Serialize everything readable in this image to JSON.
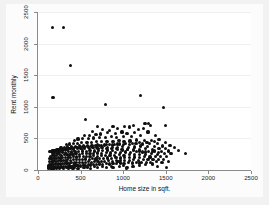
{
  "chart_data": {
    "type": "scatter",
    "title": "",
    "xlabel": "Home size in sqft.",
    "ylabel": "Rent monthly",
    "xlim": [
      0,
      2500
    ],
    "ylim": [
      0,
      2500
    ],
    "xticks": [
      0,
      500,
      1000,
      1500,
      2000,
      2500
    ],
    "yticks": [
      0,
      500,
      1000,
      1500,
      2000,
      2500
    ],
    "xticklabels": [
      "0",
      "500",
      "1000",
      "1500",
      "2000",
      "2500"
    ],
    "yticklabels": [
      "0",
      "500",
      "1000",
      "1500",
      "2000",
      "2500"
    ],
    "grid": "horizontal",
    "legend": "none",
    "marker": {
      "shape": "circle",
      "color": "#101010",
      "size": 3
    },
    "points": [
      [
        170,
        2250
      ],
      [
        300,
        2250
      ],
      [
        385,
        1655
      ],
      [
        175,
        1150
      ],
      [
        1200,
        1180
      ],
      [
        790,
        1035
      ],
      [
        1470,
        995
      ],
      [
        560,
        800
      ],
      [
        1500,
        700
      ],
      [
        1255,
        735
      ],
      [
        1300,
        730
      ],
      [
        1320,
        700
      ],
      [
        1120,
        700
      ],
      [
        1070,
        680
      ],
      [
        1015,
        690
      ],
      [
        880,
        690
      ],
      [
        700,
        690
      ],
      [
        930,
        660
      ],
      [
        1235,
        655
      ],
      [
        1180,
        640
      ],
      [
        840,
        620
      ],
      [
        760,
        640
      ],
      [
        640,
        615
      ],
      [
        1290,
        600
      ],
      [
        1135,
        590
      ],
      [
        1045,
        580
      ],
      [
        985,
        600
      ],
      [
        905,
        575
      ],
      [
        820,
        590
      ],
      [
        735,
        570
      ],
      [
        680,
        560
      ],
      [
        600,
        550
      ],
      [
        545,
        540
      ],
      [
        1380,
        540
      ],
      [
        1200,
        545
      ],
      [
        1100,
        535
      ],
      [
        1000,
        530
      ],
      [
        925,
        520
      ],
      [
        860,
        525
      ],
      [
        790,
        515
      ],
      [
        720,
        520
      ],
      [
        655,
        505
      ],
      [
        590,
        500
      ],
      [
        520,
        495
      ],
      [
        470,
        490
      ],
      [
        425,
        470
      ],
      [
        1420,
        480
      ],
      [
        1330,
        470
      ],
      [
        1250,
        465
      ],
      [
        1160,
        475
      ],
      [
        1080,
        460
      ],
      [
        1010,
        455
      ],
      [
        950,
        465
      ],
      [
        880,
        450
      ],
      [
        810,
        455
      ],
      [
        745,
        445
      ],
      [
        690,
        450
      ],
      [
        630,
        440
      ],
      [
        575,
        435
      ],
      [
        515,
        430
      ],
      [
        465,
        425
      ],
      [
        415,
        420
      ],
      [
        370,
        410
      ],
      [
        330,
        400
      ],
      [
        1500,
        430
      ],
      [
        1400,
        420
      ],
      [
        1310,
        415
      ],
      [
        1230,
        410
      ],
      [
        1150,
        420
      ],
      [
        1075,
        405
      ],
      [
        1000,
        400
      ],
      [
        930,
        410
      ],
      [
        870,
        395
      ],
      [
        805,
        400
      ],
      [
        750,
        390
      ],
      [
        695,
        395
      ],
      [
        640,
        385
      ],
      [
        585,
        390
      ],
      [
        535,
        380
      ],
      [
        485,
        385
      ],
      [
        440,
        375
      ],
      [
        395,
        370
      ],
      [
        350,
        365
      ],
      [
        310,
        360
      ],
      [
        270,
        350
      ],
      [
        1550,
        390
      ],
      [
        1460,
        380
      ],
      [
        1370,
        375
      ],
      [
        1285,
        370
      ],
      [
        1205,
        380
      ],
      [
        1130,
        365
      ],
      [
        1060,
        360
      ],
      [
        995,
        370
      ],
      [
        930,
        355
      ],
      [
        870,
        360
      ],
      [
        815,
        350
      ],
      [
        760,
        355
      ],
      [
        705,
        345
      ],
      [
        650,
        350
      ],
      [
        600,
        340
      ],
      [
        550,
        345
      ],
      [
        505,
        335
      ],
      [
        460,
        340
      ],
      [
        420,
        330
      ],
      [
        380,
        335
      ],
      [
        340,
        325
      ],
      [
        300,
        320
      ],
      [
        265,
        315
      ],
      [
        230,
        310
      ],
      [
        200,
        300
      ],
      [
        1600,
        350
      ],
      [
        1500,
        340
      ],
      [
        1420,
        335
      ],
      [
        1340,
        330
      ],
      [
        1265,
        340
      ],
      [
        1190,
        325
      ],
      [
        1120,
        320
      ],
      [
        1055,
        330
      ],
      [
        990,
        315
      ],
      [
        930,
        320
      ],
      [
        870,
        310
      ],
      [
        815,
        315
      ],
      [
        760,
        305
      ],
      [
        710,
        310
      ],
      [
        660,
        300
      ],
      [
        610,
        305
      ],
      [
        565,
        295
      ],
      [
        520,
        300
      ],
      [
        475,
        290
      ],
      [
        435,
        295
      ],
      [
        395,
        285
      ],
      [
        360,
        290
      ],
      [
        325,
        280
      ],
      [
        290,
        285
      ],
      [
        255,
        275
      ],
      [
        225,
        270
      ],
      [
        195,
        265
      ],
      [
        170,
        260
      ],
      [
        1650,
        310
      ],
      [
        1530,
        300
      ],
      [
        1450,
        295
      ],
      [
        1370,
        300
      ],
      [
        1295,
        290
      ],
      [
        1225,
        285
      ],
      [
        1155,
        295
      ],
      [
        1090,
        280
      ],
      [
        1030,
        285
      ],
      [
        970,
        275
      ],
      [
        910,
        280
      ],
      [
        855,
        270
      ],
      [
        800,
        275
      ],
      [
        750,
        265
      ],
      [
        700,
        270
      ],
      [
        655,
        260
      ],
      [
        610,
        265
      ],
      [
        565,
        255
      ],
      [
        525,
        260
      ],
      [
        485,
        250
      ],
      [
        445,
        255
      ],
      [
        410,
        245
      ],
      [
        375,
        250
      ],
      [
        340,
        240
      ],
      [
        310,
        245
      ],
      [
        280,
        235
      ],
      [
        250,
        240
      ],
      [
        220,
        230
      ],
      [
        195,
        235
      ],
      [
        170,
        225
      ],
      [
        145,
        220
      ],
      [
        1730,
        265
      ],
      [
        1560,
        255
      ],
      [
        1480,
        260
      ],
      [
        1400,
        250
      ],
      [
        1330,
        255
      ],
      [
        1260,
        245
      ],
      [
        1195,
        250
      ],
      [
        1130,
        240
      ],
      [
        1070,
        245
      ],
      [
        1010,
        235
      ],
      [
        955,
        240
      ],
      [
        900,
        230
      ],
      [
        845,
        235
      ],
      [
        795,
        225
      ],
      [
        745,
        230
      ],
      [
        700,
        220
      ],
      [
        655,
        225
      ],
      [
        610,
        215
      ],
      [
        570,
        220
      ],
      [
        530,
        210
      ],
      [
        490,
        215
      ],
      [
        455,
        205
      ],
      [
        420,
        210
      ],
      [
        385,
        200
      ],
      [
        355,
        205
      ],
      [
        320,
        195
      ],
      [
        290,
        200
      ],
      [
        265,
        190
      ],
      [
        240,
        195
      ],
      [
        215,
        185
      ],
      [
        190,
        190
      ],
      [
        165,
        180
      ],
      [
        140,
        185
      ],
      [
        1505,
        215
      ],
      [
        1440,
        210
      ],
      [
        1380,
        215
      ],
      [
        1315,
        205
      ],
      [
        1250,
        210
      ],
      [
        1190,
        200
      ],
      [
        1130,
        205
      ],
      [
        1075,
        195
      ],
      [
        1020,
        200
      ],
      [
        965,
        190
      ],
      [
        915,
        195
      ],
      [
        865,
        185
      ],
      [
        815,
        190
      ],
      [
        770,
        180
      ],
      [
        725,
        185
      ],
      [
        680,
        175
      ],
      [
        640,
        180
      ],
      [
        600,
        170
      ],
      [
        560,
        175
      ],
      [
        520,
        165
      ],
      [
        485,
        170
      ],
      [
        450,
        160
      ],
      [
        415,
        165
      ],
      [
        385,
        155
      ],
      [
        350,
        160
      ],
      [
        320,
        150
      ],
      [
        295,
        155
      ],
      [
        270,
        145
      ],
      [
        245,
        150
      ],
      [
        220,
        140
      ],
      [
        195,
        145
      ],
      [
        175,
        135
      ],
      [
        155,
        140
      ],
      [
        135,
        130
      ],
      [
        1470,
        170
      ],
      [
        1410,
        165
      ],
      [
        1350,
        170
      ],
      [
        1290,
        160
      ],
      [
        1235,
        165
      ],
      [
        1180,
        155
      ],
      [
        1125,
        160
      ],
      [
        1070,
        150
      ],
      [
        1020,
        155
      ],
      [
        970,
        145
      ],
      [
        920,
        150
      ],
      [
        875,
        140
      ],
      [
        830,
        145
      ],
      [
        785,
        135
      ],
      [
        745,
        140
      ],
      [
        705,
        130
      ],
      [
        665,
        135
      ],
      [
        625,
        125
      ],
      [
        590,
        130
      ],
      [
        555,
        120
      ],
      [
        520,
        125
      ],
      [
        485,
        115
      ],
      [
        455,
        120
      ],
      [
        425,
        110
      ],
      [
        395,
        115
      ],
      [
        365,
        105
      ],
      [
        340,
        110
      ],
      [
        315,
        100
      ],
      [
        290,
        105
      ],
      [
        265,
        95
      ],
      [
        245,
        100
      ],
      [
        225,
        90
      ],
      [
        205,
        95
      ],
      [
        185,
        85
      ],
      [
        165,
        90
      ],
      [
        150,
        80
      ],
      [
        135,
        85
      ],
      [
        120,
        75
      ],
      [
        1530,
        130
      ],
      [
        1455,
        125
      ],
      [
        1390,
        130
      ],
      [
        1325,
        120
      ],
      [
        1270,
        125
      ],
      [
        1215,
        115
      ],
      [
        1160,
        120
      ],
      [
        1110,
        110
      ],
      [
        1060,
        115
      ],
      [
        1010,
        105
      ],
      [
        965,
        110
      ],
      [
        920,
        100
      ],
      [
        880,
        105
      ],
      [
        840,
        95
      ],
      [
        800,
        100
      ],
      [
        760,
        90
      ],
      [
        725,
        95
      ],
      [
        690,
        85
      ],
      [
        655,
        90
      ],
      [
        620,
        80
      ],
      [
        590,
        85
      ],
      [
        560,
        75
      ],
      [
        530,
        80
      ],
      [
        500,
        70
      ],
      [
        470,
        75
      ],
      [
        445,
        65
      ],
      [
        420,
        70
      ],
      [
        395,
        60
      ],
      [
        370,
        65
      ],
      [
        345,
        55
      ],
      [
        325,
        60
      ],
      [
        300,
        50
      ],
      [
        280,
        55
      ],
      [
        260,
        45
      ],
      [
        240,
        50
      ],
      [
        220,
        40
      ],
      [
        200,
        45
      ],
      [
        185,
        35
      ],
      [
        170,
        40
      ],
      [
        155,
        30
      ],
      [
        140,
        35
      ],
      [
        125,
        28
      ],
      [
        1045,
        45
      ],
      [
        1510,
        40
      ],
      [
        880,
        35
      ],
      [
        805,
        42
      ],
      [
        700,
        38
      ],
      [
        615,
        30
      ],
      [
        540,
        35
      ],
      [
        470,
        25
      ],
      [
        410,
        32
      ],
      [
        355,
        22
      ],
      [
        300,
        28
      ],
      [
        255,
        18
      ],
      [
        215,
        24
      ],
      [
        180,
        15
      ],
      [
        150,
        20
      ],
      [
        1040,
        20
      ],
      [
        960,
        60
      ],
      [
        1115,
        60
      ],
      [
        1190,
        70
      ],
      [
        1265,
        85
      ],
      [
        1340,
        95
      ],
      [
        1400,
        60
      ],
      [
        1190,
        110
      ],
      [
        940,
        130
      ],
      [
        1000,
        70
      ],
      [
        860,
        60
      ],
      [
        760,
        55
      ],
      [
        660,
        60
      ],
      [
        580,
        48
      ],
      [
        500,
        52
      ],
      [
        430,
        45
      ],
      [
        375,
        48
      ],
      [
        330,
        40
      ],
      [
        285,
        44
      ],
      [
        245,
        36
      ],
      [
        210,
        40
      ],
      [
        175,
        32
      ],
      [
        145,
        38
      ],
      [
        125,
        48
      ],
      [
        1260,
        285
      ],
      [
        1340,
        290
      ],
      [
        1415,
        275
      ],
      [
        1195,
        300
      ],
      [
        1120,
        310
      ],
      [
        1048,
        320
      ],
      [
        985,
        330
      ],
      [
        920,
        335
      ],
      [
        860,
        340
      ],
      [
        800,
        345
      ],
      [
        745,
        350
      ],
      [
        690,
        355
      ],
      [
        640,
        360
      ],
      [
        590,
        365
      ],
      [
        545,
        360
      ],
      [
        500,
        355
      ],
      [
        460,
        350
      ],
      [
        420,
        345
      ],
      [
        385,
        340
      ],
      [
        350,
        335
      ],
      [
        318,
        330
      ],
      [
        288,
        325
      ],
      [
        260,
        320
      ],
      [
        235,
        315
      ],
      [
        212,
        310
      ],
      [
        190,
        305
      ],
      [
        170,
        300
      ],
      [
        152,
        295
      ],
      [
        1370,
        450
      ],
      [
        1280,
        440
      ],
      [
        1190,
        430
      ],
      [
        1105,
        425
      ],
      [
        1030,
        415
      ],
      [
        960,
        410
      ],
      [
        895,
        405
      ],
      [
        835,
        400
      ],
      [
        778,
        395
      ],
      [
        725,
        390
      ],
      [
        675,
        385
      ],
      [
        628,
        380
      ],
      [
        583,
        375
      ],
      [
        540,
        370
      ],
      [
        500,
        365
      ],
      [
        462,
        360
      ],
      [
        427,
        355
      ],
      [
        394,
        350
      ],
      [
        363,
        345
      ],
      [
        334,
        340
      ],
      [
        307,
        335
      ],
      [
        282,
        330
      ],
      [
        259,
        325
      ],
      [
        238,
        320
      ],
      [
        218,
        315
      ],
      [
        200,
        310
      ],
      [
        183,
        305
      ],
      [
        168,
        300
      ],
      [
        154,
        295
      ],
      [
        141,
        290
      ]
    ]
  },
  "axes": {
    "x_title": "Home size in sqft.",
    "y_title": "Rent monthly"
  },
  "colors": {
    "marker": "#101010",
    "axis": "#8a8a8a",
    "grid": "#eef0f2",
    "plot_background": "#ffffff",
    "figure_background": "#f2f2f2"
  }
}
